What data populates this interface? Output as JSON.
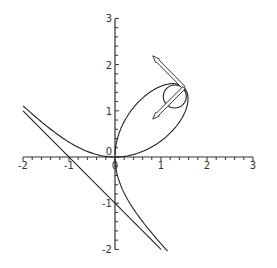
{
  "chart_data": {
    "type": "line",
    "title": "",
    "xlabel": "",
    "ylabel": "",
    "xlim": [
      -2,
      3
    ],
    "ylim": [
      -2,
      3
    ],
    "grid": false,
    "legend": null,
    "x_ticks": [
      -2,
      -1,
      0,
      1,
      2,
      3
    ],
    "x_tick_labels": [
      "-2",
      "-1",
      "0",
      "1",
      "2",
      "3"
    ],
    "y_ticks": [
      -2,
      -1,
      1,
      2,
      3
    ],
    "y_tick_labels": [
      "-2",
      "-1",
      "1",
      "2",
      "3"
    ],
    "origin_label": "0",
    "minor_ticks_per_unit": 5,
    "series": [
      {
        "name": "Folium of Descartes x^3 + y^3 = 3xy",
        "kind": "parametric",
        "x_expr": "3t/(1+t^3)",
        "y_expr": "3t^2/(1+t^3)",
        "sample_points": [
          [
            -2,
            1.1
          ],
          [
            -1,
            0.45
          ],
          [
            -0.3,
            0.03
          ],
          [
            0,
            0
          ],
          [
            0.5,
            0.2
          ],
          [
            1.2,
            0.8
          ],
          [
            1.5,
            1.5
          ],
          [
            1.0,
            1.0
          ],
          [
            0.3,
            0.75
          ],
          [
            0.05,
            0.35
          ],
          [
            0,
            0
          ],
          [
            0.05,
            -0.5
          ],
          [
            0.3,
            -1.2
          ],
          [
            1.1,
            -2.0
          ]
        ],
        "color": "#222222"
      },
      {
        "name": "Asymptote x + y = -1",
        "kind": "line",
        "points": [
          [
            -2,
            1
          ],
          [
            1,
            -2
          ]
        ],
        "color": "#222222"
      },
      {
        "name": "Osculating circle at (1.5, 1.5)",
        "kind": "circle",
        "center": [
          1.3,
          1.31
        ],
        "radius": 0.25,
        "color": "#222222"
      },
      {
        "name": "Tangent vector",
        "kind": "arrow",
        "from": [
          1.5,
          1.5
        ],
        "to": [
          0.82,
          2.19
        ],
        "color": "#222222"
      },
      {
        "name": "Normal vector",
        "kind": "arrow",
        "from": [
          1.5,
          1.5
        ],
        "to": [
          0.82,
          0.82
        ],
        "color": "#222222"
      }
    ]
  },
  "layout": {
    "origin_px": [
      115,
      157
    ],
    "px_per_unit_x": 46,
    "px_per_unit_y": 46.2
  }
}
